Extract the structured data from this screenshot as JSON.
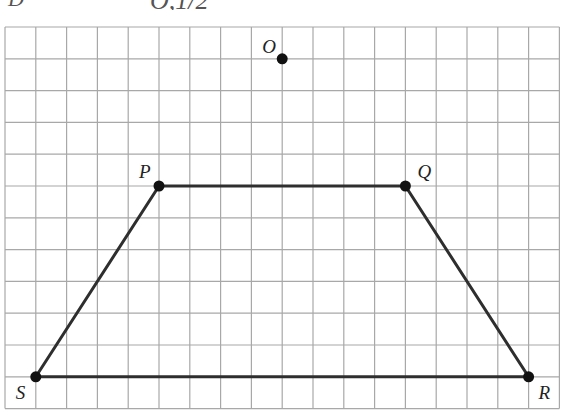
{
  "header": {
    "left_fragment": "",
    "notation": "D",
    "subscript": "O,1/2"
  },
  "grid": {
    "left": 5,
    "top": 27,
    "cols": 18,
    "rows": 12,
    "cell_w": 30.8,
    "cell_h": 31.8,
    "line_color": "#a8a8a8"
  },
  "figure": {
    "stroke_color": "#2e2e2e",
    "point_color": "#111111",
    "points": [
      {
        "id": "O",
        "label": "O",
        "col": 9,
        "row": 1,
        "label_dx": -20,
        "label_dy": -6
      },
      {
        "id": "P",
        "label": "P",
        "col": 5,
        "row": 5,
        "label_dx": -20,
        "label_dy": -8
      },
      {
        "id": "Q",
        "label": "Q",
        "col": 13,
        "row": 5,
        "label_dx": 12,
        "label_dy": -8
      },
      {
        "id": "R",
        "label": "R",
        "col": 17,
        "row": 11,
        "label_dx": 10,
        "label_dy": 22
      },
      {
        "id": "S",
        "label": "S",
        "col": 1,
        "row": 11,
        "label_dx": -20,
        "label_dy": 22
      }
    ],
    "polygon": [
      "P",
      "Q",
      "R",
      "S"
    ]
  }
}
